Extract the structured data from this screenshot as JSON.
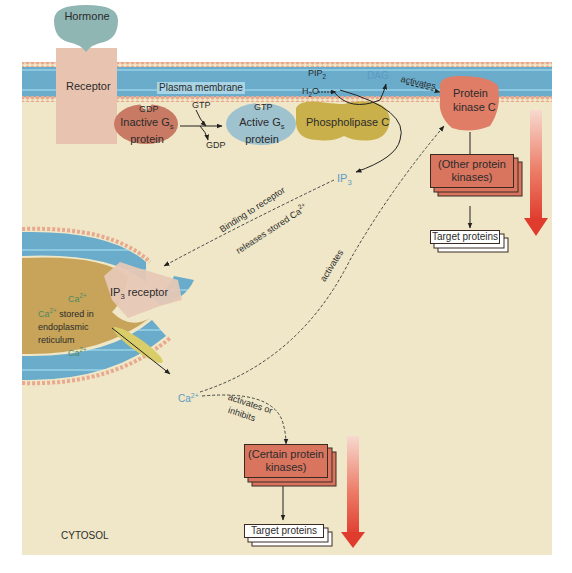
{
  "diagram": {
    "colors": {
      "cytosol": "#efe7c7",
      "membrane_heads": "#e9a98f",
      "membrane_tails": "#7fc0dc",
      "hormone": "#8fb6b3",
      "receptor": "#e8c4b0",
      "inactive_g": "#c97a64",
      "active_g": "#9fc2cf",
      "phospholipase": "#c9b04a",
      "pkc": "#e07d66",
      "kinase_box": "#d9755f",
      "er_lumen": "#c8a45a",
      "channel": "#d9cd6a",
      "gradient_arrow": "#e0473a",
      "blue_text": "#5a9bc4",
      "green_text": "#4f8a60"
    },
    "top": {
      "hormone": "Hormone",
      "receptor": "Receptor",
      "plasma_membrane": "Plasma membrane"
    },
    "g_protein": {
      "inactive_line1": "Inactive G",
      "inactive_sub": "s",
      "inactive_line2": "protein",
      "inactive_bound": "GDP",
      "gtp_in": "GTP",
      "gdp_out": "GDP",
      "active_line1": "Active G",
      "active_sub": "s",
      "active_line2": "protein",
      "active_bound": "GTP"
    },
    "enzymes": {
      "phospholipase": "Phospholipase C",
      "pkc_line1": "Protein",
      "pkc_line2": "kinase C"
    },
    "messengers": {
      "h2o_h": "H",
      "h2o_sub": "2",
      "h2o_o": "O",
      "pip2": "PIP",
      "pip2_sub": "2",
      "dag": "DAG",
      "ip3": "IP",
      "ip3_sub": "3",
      "ca": "Ca",
      "ca_sup": "2+"
    },
    "arrow_labels": {
      "dag_activates": "activates",
      "binding_line1": "Binding to receptor",
      "binding_line2_pre": "releases stored Ca",
      "binding_line2_sup": "2+",
      "ca_activates_pkc": "activates",
      "activates_or": "activates or",
      "inhibits": "inhibits"
    },
    "er": {
      "ip3_receptor_pre": "IP",
      "ip3_receptor_sub": "3",
      "ip3_receptor_post": " receptor",
      "ca_top": "Ca",
      "ca_sup": "2+",
      "stored_pre": "Ca",
      "stored_sup": "2+",
      "stored_line1": " stored in",
      "stored_line2": "endoplasmic",
      "stored_line3": "reticulum",
      "ca_bottom": "Ca"
    },
    "cascade_right": {
      "kinases": "(Other protein kinases)",
      "kinases_line1": "(Other protein",
      "kinases_line2": "kinases)",
      "targets": "Target proteins"
    },
    "cascade_bottom": {
      "kinases_line1": "(Certain protein",
      "kinases_line2": "kinases)",
      "targets": "Target proteins"
    },
    "region_label": "CYTOSOL"
  }
}
